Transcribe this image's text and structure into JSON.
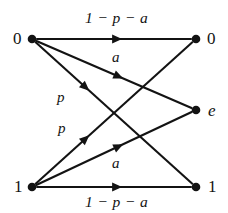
{
  "figure": {
    "type": "directed-graph",
    "background_color": "#ffffff",
    "ink_color": "#131313"
  },
  "nodes": [
    {
      "id": "in-0",
      "label": "0",
      "side": "input",
      "italic": false,
      "x": 32,
      "y": 39,
      "label_x": 13,
      "label_y": 30
    },
    {
      "id": "in-1",
      "label": "1",
      "side": "input",
      "italic": false,
      "x": 32,
      "y": 187,
      "label_x": 14,
      "label_y": 178
    },
    {
      "id": "out-0",
      "label": "0",
      "side": "output",
      "italic": false,
      "x": 196,
      "y": 39,
      "label_x": 207,
      "label_y": 30
    },
    {
      "id": "out-e",
      "label": "e",
      "side": "output",
      "italic": true,
      "x": 196,
      "y": 110,
      "label_x": 208,
      "label_y": 102
    },
    {
      "id": "out-1",
      "label": "1",
      "side": "output",
      "italic": false,
      "x": 196,
      "y": 187,
      "label_x": 208,
      "label_y": 178
    }
  ],
  "edges": [
    {
      "id": "e-0-0",
      "from": "in-0",
      "to": "out-0",
      "label": "1 − p − a",
      "label_kind": "expression",
      "label_x": 85,
      "label_y": 10,
      "x1": 32,
      "y1": 39,
      "x2": 196,
      "y2": 39,
      "arrow_t": 0.52
    },
    {
      "id": "e-0-e",
      "from": "in-0",
      "to": "out-e",
      "label": "a",
      "label_kind": "symbol",
      "label_x": 112,
      "label_y": 50,
      "x1": 32,
      "y1": 39,
      "x2": 196,
      "y2": 110,
      "arrow_t": 0.53
    },
    {
      "id": "e-0-1",
      "from": "in-0",
      "to": "out-1",
      "label": "p",
      "label_kind": "symbol",
      "label_x": 57,
      "label_y": 90,
      "x1": 32,
      "y1": 39,
      "x2": 196,
      "y2": 187,
      "arrow_t": 0.32
    },
    {
      "id": "e-1-0",
      "from": "in-1",
      "to": "out-0",
      "label": "p",
      "label_kind": "symbol",
      "label_x": 58,
      "label_y": 121,
      "x1": 32,
      "y1": 187,
      "x2": 196,
      "y2": 39,
      "arrow_t": 0.32
    },
    {
      "id": "e-1-e",
      "from": "in-1",
      "to": "out-e",
      "label": "a",
      "label_kind": "symbol",
      "label_x": 112,
      "label_y": 156,
      "x1": 32,
      "y1": 187,
      "x2": 196,
      "y2": 110,
      "arrow_t": 0.53
    },
    {
      "id": "e-1-1",
      "from": "in-1",
      "to": "out-1",
      "label": "1 − p − a",
      "label_kind": "expression",
      "label_x": 85,
      "label_y": 194,
      "x1": 32,
      "y1": 187,
      "x2": 196,
      "y2": 187,
      "arrow_t": 0.52
    }
  ],
  "labels": {
    "top_expression": "1 − p − a",
    "bottom_expression": "1 − p − a",
    "upper_a": "a",
    "lower_a": "a",
    "upper_p": "p",
    "lower_p": "p",
    "input_0": "0",
    "input_1": "1",
    "output_0": "0",
    "output_e": "e",
    "output_1": "1"
  }
}
